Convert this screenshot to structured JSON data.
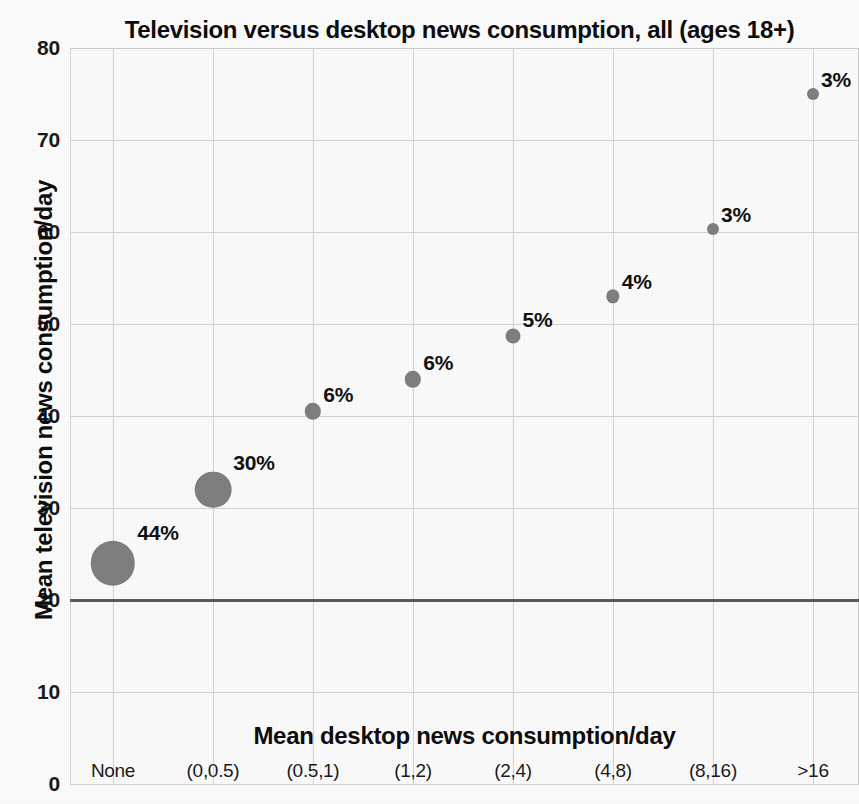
{
  "chart_data": {
    "type": "scatter",
    "title": "Television versus desktop news consumption, all (ages 18+)",
    "xlabel": "Mean desktop news consumption/day",
    "ylabel": "Mean television news consumption/day",
    "categories": [
      "None",
      "(0,0.5)",
      "(0.5,1)",
      "(1,2)",
      "(2,4)",
      "(4,8)",
      "(8,16)",
      ">16"
    ],
    "values": [
      24,
      32,
      40.5,
      44,
      48.7,
      53,
      60.3,
      75
    ],
    "point_labels": [
      "44%",
      "30%",
      "6%",
      "6%",
      "5%",
      "4%",
      "3%",
      "3%"
    ],
    "point_sizes_pct": [
      44,
      30,
      6,
      6,
      5,
      4,
      3,
      3
    ],
    "ylim": [
      0,
      80
    ],
    "y_ticks": [
      "0",
      "10",
      "20",
      "30",
      "40",
      "50",
      "60",
      "70",
      "80"
    ],
    "y_tick_values": [
      0,
      10,
      20,
      30,
      40,
      50,
      60,
      70,
      80
    ],
    "grid": true,
    "legend": "none",
    "reference_line_y": 20,
    "marker_color": "#7e7e7e",
    "reference_line_color": "#5a5a5a",
    "grid_color": "#d2d2d2",
    "background_color": "#fafafa",
    "series": [
      {
        "name": "Mean television news consumption/day",
        "points": [
          {
            "category": "None",
            "value": 24,
            "label": "44%",
            "size_pct": 44
          },
          {
            "category": "(0,0.5)",
            "value": 32,
            "label": "30%",
            "size_pct": 30
          },
          {
            "category": "(0.5,1)",
            "value": 40.5,
            "label": "6%",
            "size_pct": 6
          },
          {
            "category": "(1,2)",
            "value": 44,
            "label": "6%",
            "size_pct": 6
          },
          {
            "category": "(2,4)",
            "value": 48.7,
            "label": "5%",
            "size_pct": 5
          },
          {
            "category": "(4,8)",
            "value": 53,
            "label": "4%",
            "size_pct": 4
          },
          {
            "category": "(8,16)",
            "value": 60.3,
            "label": "3%",
            "size_pct": 3
          },
          {
            "category": ">16",
            "value": 75,
            "label": "3%",
            "size_pct": 3
          }
        ]
      }
    ]
  }
}
